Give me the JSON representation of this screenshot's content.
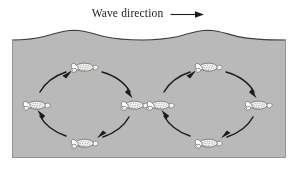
{
  "figure": {
    "title": "Wave direction",
    "arrow_icon": "right-arrow-icon",
    "background_color": "#ffffff",
    "water_color": "#b9b9b9",
    "water_outline_color": "#3d3d3d",
    "ink_color": "#1c1c1c",
    "turtle_body_color": "#f4f4f2",
    "turtle_outline_color": "#4a4a4a",
    "panel": {
      "x": 12,
      "y": 26,
      "width": 274,
      "height": 132
    },
    "wave": {
      "crest_count": 2,
      "crest_x": [
        62,
        186
      ],
      "crest_y": 30,
      "trough_y": 40,
      "surface_label": "water-surface"
    },
    "orbits": [
      {
        "id": "orbit-left",
        "label": "circular orbital motion left",
        "center_x": 72,
        "center_y": 78,
        "radius_x": 48,
        "radius_y": 38,
        "rotation": "clockwise",
        "turtles": [
          {
            "id": "turtle-left-top",
            "position": "top",
            "x": 72,
            "y": 40,
            "flip": false
          },
          {
            "id": "turtle-left-right",
            "position": "right",
            "x": 120,
            "y": 78,
            "flip": false
          },
          {
            "id": "turtle-left-bottom",
            "position": "bottom",
            "x": 72,
            "y": 116,
            "flip": false
          },
          {
            "id": "turtle-left-left",
            "position": "left",
            "x": 24,
            "y": 78,
            "flip": false
          }
        ],
        "arrows": [
          {
            "id": "arrow-left-top-right",
            "from": "top",
            "to": "right"
          },
          {
            "id": "arrow-left-right-bottom",
            "from": "right",
            "to": "bottom"
          },
          {
            "id": "arrow-left-bottom-left",
            "from": "bottom",
            "to": "left"
          },
          {
            "id": "arrow-left-left-top",
            "from": "left",
            "to": "top"
          }
        ]
      },
      {
        "id": "orbit-right",
        "label": "circular orbital motion right",
        "center_x": 196,
        "center_y": 78,
        "radius_x": 48,
        "radius_y": 38,
        "rotation": "clockwise",
        "turtles": [
          {
            "id": "turtle-right-top",
            "position": "top",
            "x": 196,
            "y": 40,
            "flip": false
          },
          {
            "id": "turtle-right-right",
            "position": "right",
            "x": 244,
            "y": 78,
            "flip": false
          },
          {
            "id": "turtle-right-bottom",
            "position": "bottom",
            "x": 196,
            "y": 116,
            "flip": false
          },
          {
            "id": "turtle-right-left",
            "position": "left",
            "x": 148,
            "y": 78,
            "flip": false
          }
        ],
        "arrows": [
          {
            "id": "arrow-right-top-right",
            "from": "top",
            "to": "right"
          },
          {
            "id": "arrow-right-right-bottom",
            "from": "right",
            "to": "bottom"
          },
          {
            "id": "arrow-right-bottom-left",
            "from": "bottom",
            "to": "left"
          },
          {
            "id": "arrow-right-left-top",
            "from": "left",
            "to": "top"
          }
        ]
      }
    ]
  }
}
